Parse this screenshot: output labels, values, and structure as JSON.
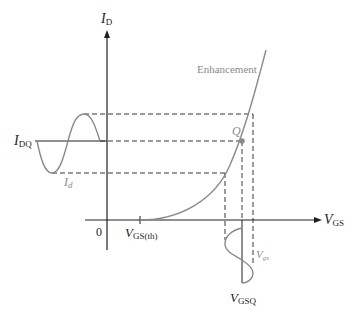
{
  "diagram": {
    "colors": {
      "axis": "#231f20",
      "curve": "#8a8a8a",
      "dashed": "#231f20",
      "q_point": "#8a8a8a",
      "background": "#ffffff"
    },
    "axes": {
      "y": {
        "symbol": "I",
        "subscript": "D"
      },
      "x": {
        "symbol": "V",
        "subscript": "GS"
      },
      "origin": "0"
    },
    "labels": {
      "idq": {
        "symbol": "I",
        "subscript": "DQ"
      },
      "id": {
        "symbol": "I",
        "subscript": "d"
      },
      "vgs_th": {
        "symbol": "V",
        "subscript": "GS(th)"
      },
      "vgsq": {
        "symbol": "V",
        "subscript": "GSQ"
      },
      "vgs_signal": {
        "symbol": "V",
        "subscript": "gs"
      },
      "q": "Q",
      "curve_name": "Enhancement"
    }
  }
}
